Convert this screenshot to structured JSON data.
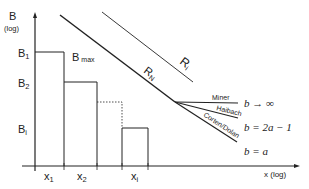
{
  "y_axis": {
    "label": "B",
    "sublabel": "(log)"
  },
  "x_axis": {
    "label": "x (log)"
  },
  "y_ticks": [
    {
      "main": "B",
      "sub": "1"
    },
    {
      "main": "B",
      "sub": "2"
    },
    {
      "main": "B",
      "sub": "i"
    }
  ],
  "x_ticks": [
    {
      "main": "x",
      "sub": "1"
    },
    {
      "main": "x",
      "sub": "2"
    },
    {
      "main": "x",
      "sub": "i"
    }
  ],
  "bmax": {
    "main": "B",
    "sub": "max"
  },
  "lines": {
    "rn": {
      "main": "R",
      "sub": "N"
    },
    "ri": {
      "main": "R",
      "sub": "i"
    }
  },
  "branches": [
    {
      "name": "Miner",
      "formula": "b → ∞"
    },
    {
      "name": "Haibach",
      "formula": "b = 2a − 1"
    },
    {
      "name": "Corten/Dolan",
      "formula": "b = a"
    }
  ]
}
